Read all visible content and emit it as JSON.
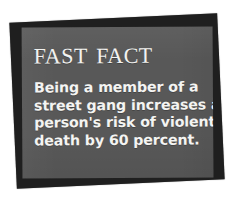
{
  "card": {
    "title": "Fast Fact",
    "body_lines": [
      "Being a member of a",
      "street gang increases a",
      "person's risk of violent",
      "death by 60 percent."
    ],
    "body_text": "Being a member of a street gang increases a person's risk of violent death by 60 percent.",
    "statistic": "60 percent",
    "colors": {
      "page_background": "#ffffff",
      "front_card": "#585858",
      "back_card": "#1f1f1f",
      "text": "#f4f4f2"
    }
  }
}
